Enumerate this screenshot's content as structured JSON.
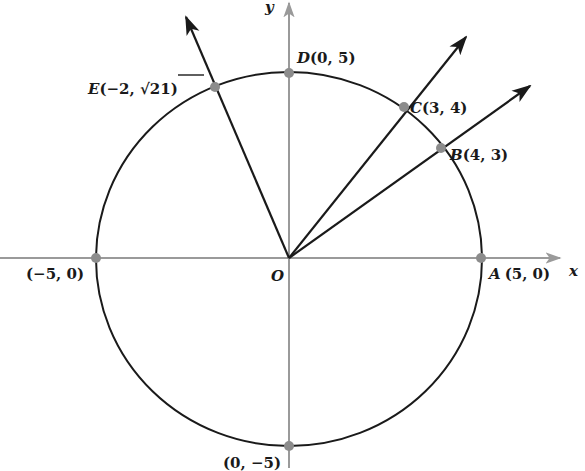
{
  "diagram": {
    "type": "unit-circle-style coordinate diagram",
    "circle": {
      "radius_units": 5,
      "center": "O"
    },
    "axes": {
      "x_label": "x",
      "y_label": "y",
      "origin_label": "O",
      "axis_color": "#9a9a9a"
    },
    "points": [
      {
        "id": "A",
        "name": "A",
        "coords": "(5, 0)",
        "x": 5,
        "y": 0
      },
      {
        "id": "B",
        "name": "B",
        "coords": "(4, 3)",
        "x": 4,
        "y": 3
      },
      {
        "id": "C",
        "name": "C",
        "coords": "(3, 4)",
        "x": 3,
        "y": 4
      },
      {
        "id": "D",
        "name": "D",
        "coords": "(0, 5)",
        "x": 0,
        "y": 5
      },
      {
        "id": "E",
        "name": "E",
        "coords_prefix": "(−2, ",
        "coords_sqrt": "21",
        "coords_suffix": ")",
        "x": -2,
        "y": "√21"
      },
      {
        "id": "left",
        "name": "",
        "coords": "(−5, 0)",
        "x": -5,
        "y": 0
      },
      {
        "id": "bottom",
        "name": "",
        "coords": "(0, −5)",
        "x": 0,
        "y": -5
      }
    ],
    "rays": [
      {
        "through": "B"
      },
      {
        "through": "C"
      },
      {
        "through": "E"
      }
    ],
    "colors": {
      "circle": "#1a1a1a",
      "ray": "#1a1a1a",
      "point": "#8c8c8c"
    }
  }
}
